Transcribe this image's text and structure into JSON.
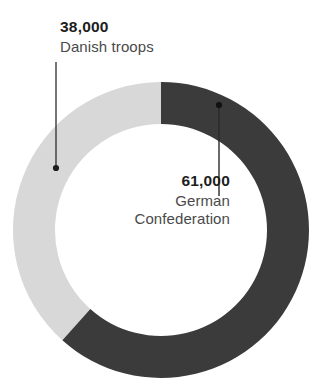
{
  "chart_data": {
    "type": "pie",
    "variant": "donut",
    "title": "",
    "subtitle": "",
    "xlabel": "",
    "ylabel": "",
    "grid": false,
    "legend": "none",
    "labels_position": "callout-annotations",
    "total": 99000,
    "categories": [
      "German Confederation",
      "Danish troops"
    ],
    "values": [
      61000,
      38000
    ],
    "value_labels": [
      "61,000",
      "38,000"
    ],
    "percentages": [
      61.6,
      38.4
    ],
    "colors": [
      "#3b3b3b",
      "#d8d8d8"
    ],
    "slices": [
      {
        "name": "German Confederation",
        "value": 61000,
        "value_label": "61,000",
        "percent": 61.6,
        "color": "#3b3b3b",
        "start_angle_deg": 0,
        "end_angle_deg": 221.8
      },
      {
        "name": "Danish troops",
        "value": 38000,
        "value_label": "38,000",
        "percent": 38.4,
        "color": "#d8d8d8",
        "start_angle_deg": 221.8,
        "end_angle_deg": 360
      }
    ]
  },
  "geometry": {
    "center_x": 161,
    "center_y": 230,
    "outer_radius": 148,
    "inner_radius": 106,
    "hole_color": "#ffffff",
    "background": "#ffffff"
  },
  "annotations": {
    "danish": {
      "value": "38,000",
      "name": "Danish troops",
      "leader_color": "#3a3a3a",
      "leader_x": 56,
      "leader_y_top": 62,
      "leader_y_bottom": 168,
      "dot_x": 56,
      "dot_y": 168
    },
    "german": {
      "value": "61,000",
      "name_line1": "German",
      "name_line2": "Confederation",
      "leader_color": "#2a2a2a",
      "leader_x": 219,
      "leader_y_top": 105,
      "leader_y_bottom": 196,
      "dot_x": 219,
      "dot_y": 105
    }
  }
}
